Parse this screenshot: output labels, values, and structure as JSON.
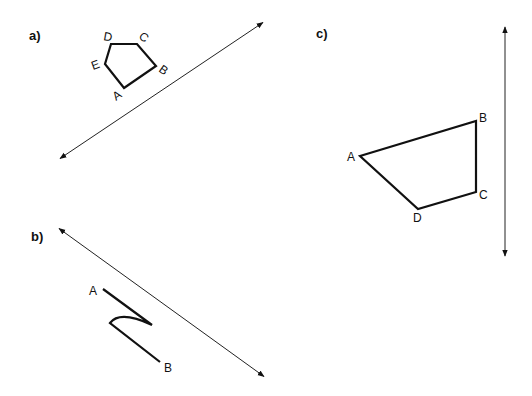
{
  "panels": [
    {
      "label": "a)",
      "shape": "pentagon",
      "vertices": [
        {
          "name": "A",
          "x": 124,
          "y": 88
        },
        {
          "name": "B",
          "x": 156,
          "y": 66
        },
        {
          "name": "C",
          "x": 137,
          "y": 44
        },
        {
          "name": "D",
          "x": 111,
          "y": 44
        },
        {
          "name": "E",
          "x": 105,
          "y": 64
        }
      ],
      "mirror_line": {
        "x1": 58,
        "y1": 160,
        "x2": 265,
        "y2": 21,
        "arrows": "both"
      }
    },
    {
      "label": "b)",
      "shape": "open curved path",
      "vertices": [
        {
          "name": "A",
          "x": 103,
          "y": 289
        },
        {
          "name": "B",
          "x": 160,
          "y": 362
        }
      ],
      "mirror_line": {
        "x1": 57,
        "y1": 227,
        "x2": 266,
        "y2": 378,
        "arrows": "both"
      }
    },
    {
      "label": "c)",
      "shape": "quadrilateral",
      "vertices": [
        {
          "name": "A",
          "x": 360,
          "y": 156
        },
        {
          "name": "B",
          "x": 476,
          "y": 121
        },
        {
          "name": "C",
          "x": 476,
          "y": 192
        },
        {
          "name": "D",
          "x": 418,
          "y": 209
        }
      ],
      "mirror_line": {
        "x1": 505,
        "y1": 25,
        "x2": 505,
        "y2": 258,
        "arrows": "both"
      }
    }
  ],
  "labels": {
    "a": "a)",
    "b": "b)",
    "c": "c)",
    "a_A": "A",
    "a_B": "B",
    "a_C": "C",
    "a_D": "D",
    "a_E": "E",
    "b_A": "A",
    "b_B": "B",
    "c_A": "A",
    "c_B": "B",
    "c_C": "C",
    "c_D": "D"
  },
  "colors": {
    "ink": "#111111",
    "background": "#ffffff"
  }
}
